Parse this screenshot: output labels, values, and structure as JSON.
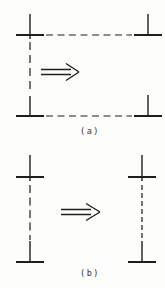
{
  "figure": {
    "panels": [
      {
        "id": "a",
        "label": "(a)"
      },
      {
        "id": "b",
        "label": "(b)"
      }
    ],
    "icons": {
      "panel_a_arrow": "right-double-arrow",
      "panel_b_arrow": "right-double-arrow"
    },
    "colors": {
      "line": "#1e1e1e",
      "text": "#333333",
      "background": "#fdfdfb"
    }
  }
}
